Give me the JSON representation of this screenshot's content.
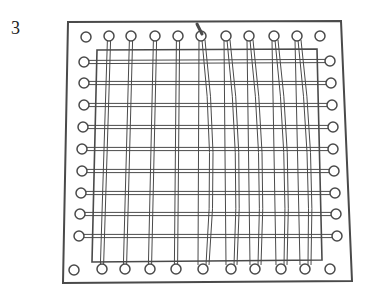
{
  "figure": {
    "step_number": "3",
    "colors": {
      "ink": "#4a4a4a",
      "background": "#ffffff"
    },
    "board": {
      "top_left": [
        68,
        22
      ],
      "top_right": [
        341,
        21
      ],
      "bottom_right": [
        352,
        281
      ],
      "bottom_left": [
        63,
        283
      ]
    },
    "inner_frame": {
      "top_left": [
        97,
        50
      ],
      "top_right": [
        317,
        49
      ],
      "bottom_right": [
        322,
        260
      ],
      "bottom_left": [
        92,
        262
      ]
    },
    "pegs": {
      "top": [
        [
          86,
          37
        ],
        [
          109,
          36
        ],
        [
          131,
          36
        ],
        [
          155,
          36
        ],
        [
          178,
          36
        ],
        [
          201,
          36
        ],
        [
          226,
          36
        ],
        [
          249,
          36
        ],
        [
          274,
          36
        ],
        [
          297,
          36
        ],
        [
          320,
          36
        ]
      ],
      "bottom": [
        [
          74,
          270
        ],
        [
          102,
          269
        ],
        [
          125,
          269
        ],
        [
          150,
          269
        ],
        [
          176,
          269
        ],
        [
          203,
          269
        ],
        [
          231,
          269
        ],
        [
          255,
          269
        ],
        [
          281,
          269
        ],
        [
          305,
          269
        ],
        [
          330,
          269
        ]
      ],
      "left": [
        [
          84,
          62
        ],
        [
          84,
          83
        ],
        [
          84,
          105
        ],
        [
          83,
          127
        ],
        [
          82,
          149
        ],
        [
          82,
          171
        ],
        [
          81,
          193
        ],
        [
          80,
          214
        ],
        [
          79,
          236
        ]
      ],
      "right": [
        [
          330,
          61
        ],
        [
          331,
          83
        ],
        [
          332,
          105
        ],
        [
          333,
          127
        ],
        [
          333,
          149
        ],
        [
          334,
          171
        ],
        [
          335,
          193
        ],
        [
          336,
          214
        ],
        [
          337,
          236
        ]
      ]
    },
    "weft_count": 9,
    "straight_warps": 4,
    "woven_warps": 5
  }
}
